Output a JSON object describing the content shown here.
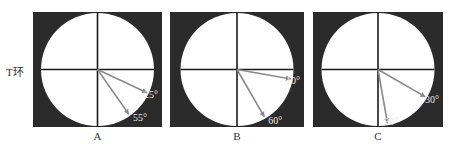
{
  "side_label": "T环",
  "colors": {
    "background": "#2b2b2b",
    "circle": "#ffffff",
    "axis": "#1a1a1a",
    "arrow": "#8a8a8a",
    "angle_text": "#e8e8e8"
  },
  "panels": [
    {
      "caption": "A",
      "angles": [
        {
          "deg": 25,
          "label": "25°"
        },
        {
          "deg": 55,
          "label": "55°"
        }
      ]
    },
    {
      "caption": "B",
      "angles": [
        {
          "deg": 10,
          "label": "10°"
        },
        {
          "deg": 60,
          "label": "60°"
        }
      ]
    },
    {
      "caption": "C",
      "angles": [
        {
          "deg": 30,
          "label": "30°"
        },
        {
          "deg": 80,
          "label": "80°"
        }
      ]
    }
  ]
}
